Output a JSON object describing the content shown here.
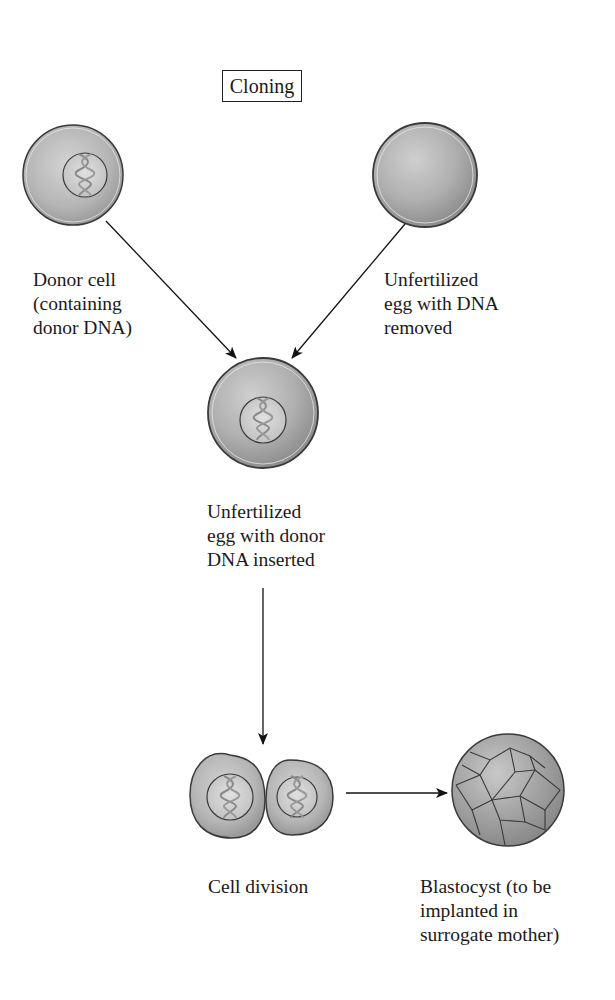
{
  "title": "Cloning",
  "nodes": {
    "donor_cell": {
      "label": "Donor cell\n(containing\ndonor DNA)"
    },
    "enucleated_egg": {
      "label": "Unfertilized\negg with DNA\nremoved"
    },
    "reconstructed_egg": {
      "label": "Unfertilized\negg with donor\nDNA inserted"
    },
    "cell_division": {
      "label": "Cell division"
    },
    "blastocyst": {
      "label": "Blastocyst (to be\nimplanted in\nsurrogate mother)"
    }
  },
  "edges": [
    {
      "from": "donor_cell",
      "to": "reconstructed_egg"
    },
    {
      "from": "enucleated_egg",
      "to": "reconstructed_egg"
    },
    {
      "from": "reconstructed_egg",
      "to": "cell_division"
    },
    {
      "from": "cell_division",
      "to": "blastocyst"
    }
  ],
  "colors": {
    "cell_fill": "#bdbdbd",
    "cell_outline": "#3a3a3a",
    "arrow": "#111111"
  }
}
